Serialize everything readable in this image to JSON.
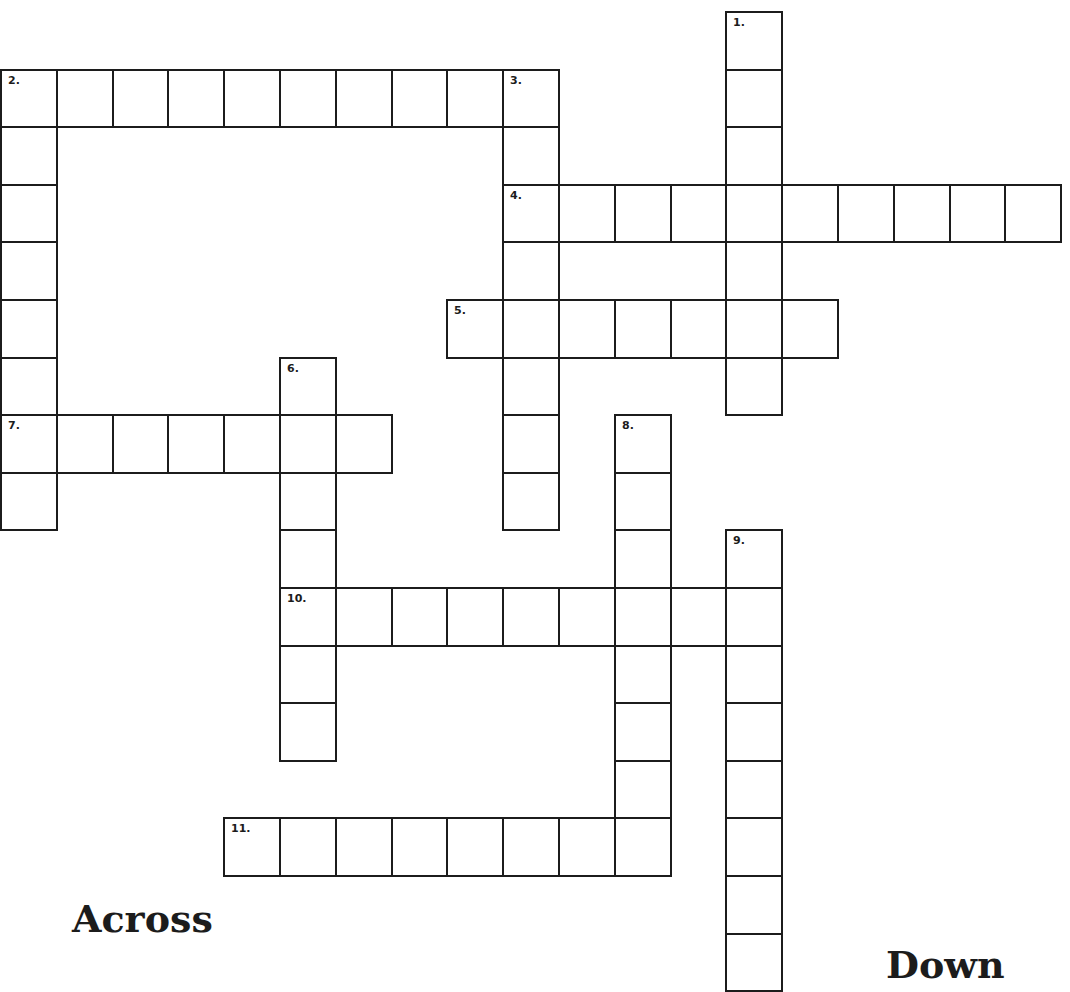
{
  "puzzle": {
    "grid_origin": {
      "x": 0,
      "y": 11
    },
    "cell_width": 55.8,
    "cell_height": 57.6,
    "line_color": "#1c1c1c",
    "words": [
      {
        "number": 1,
        "direction": "down",
        "col": 13,
        "row": 0,
        "length": 7
      },
      {
        "number": 2,
        "direction": "across",
        "col": 0,
        "row": 1,
        "length": 10
      },
      {
        "number": 2,
        "direction": "down",
        "col": 0,
        "row": 1,
        "length": 8
      },
      {
        "number": 3,
        "direction": "down",
        "col": 9,
        "row": 1,
        "length": 8
      },
      {
        "number": 4,
        "direction": "across",
        "col": 9,
        "row": 3,
        "length": 10
      },
      {
        "number": 5,
        "direction": "across",
        "col": 8,
        "row": 5,
        "length": 7
      },
      {
        "number": 6,
        "direction": "down",
        "col": 5,
        "row": 6,
        "length": 7
      },
      {
        "number": 7,
        "direction": "across",
        "col": 0,
        "row": 7,
        "length": 7
      },
      {
        "number": 8,
        "direction": "down",
        "col": 11,
        "row": 7,
        "length": 8
      },
      {
        "number": 9,
        "direction": "down",
        "col": 13,
        "row": 9,
        "length": 8
      },
      {
        "number": 10,
        "direction": "across",
        "col": 5,
        "row": 10,
        "length": 9
      },
      {
        "number": 11,
        "direction": "across",
        "col": 4,
        "row": 14,
        "length": 8
      }
    ],
    "numbered_cells": [
      {
        "label": "1.",
        "col": 13,
        "row": 0
      },
      {
        "label": "2.",
        "col": 0,
        "row": 1
      },
      {
        "label": "3.",
        "col": 9,
        "row": 1
      },
      {
        "label": "4.",
        "col": 9,
        "row": 3
      },
      {
        "label": "5.",
        "col": 8,
        "row": 5
      },
      {
        "label": "6.",
        "col": 5,
        "row": 6
      },
      {
        "label": "7.",
        "col": 0,
        "row": 7
      },
      {
        "label": "8.",
        "col": 11,
        "row": 7
      },
      {
        "label": "9.",
        "col": 13,
        "row": 9
      },
      {
        "label": "10.",
        "col": 5,
        "row": 10
      },
      {
        "label": "11.",
        "col": 4,
        "row": 14
      }
    ]
  },
  "clues": {
    "across_heading": "Across",
    "down_heading": "Down"
  }
}
